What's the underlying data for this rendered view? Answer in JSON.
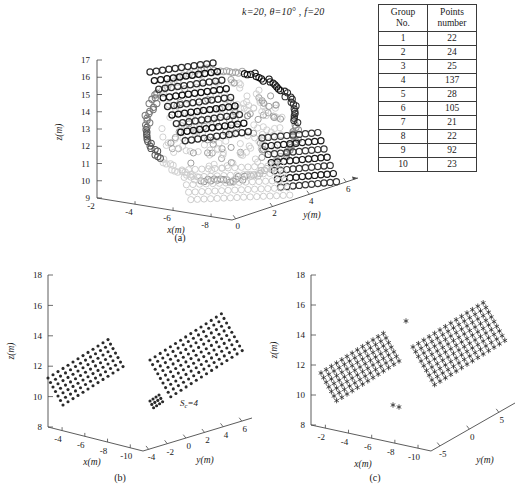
{
  "figure": {
    "title": {
      "k": "k=20",
      "theta": "θ=10°",
      "f": "f=20"
    },
    "captions": {
      "a": "(a)",
      "b": "(b)",
      "c": "(c)"
    }
  },
  "table": {
    "headers": {
      "col1_line1": "Group",
      "col1_line2": "No.",
      "col2_line1": "Points",
      "col2_line2": "number"
    },
    "rows": [
      {
        "group": "1",
        "points": "22"
      },
      {
        "group": "2",
        "points": "24"
      },
      {
        "group": "3",
        "points": "25"
      },
      {
        "group": "4",
        "points": "137"
      },
      {
        "group": "5",
        "points": "28"
      },
      {
        "group": "6",
        "points": "105"
      },
      {
        "group": "7",
        "points": "21"
      },
      {
        "group": "8",
        "points": "22"
      },
      {
        "group": "9",
        "points": "92"
      },
      {
        "group": "10",
        "points": "23"
      }
    ]
  },
  "panel_a": {
    "axis_labels": {
      "x": "x(m)",
      "y": "y(m)",
      "z": "z(m)"
    },
    "ticks": {
      "z": [
        "9",
        "10",
        "11",
        "12",
        "13",
        "14",
        "15",
        "16",
        "17"
      ],
      "x": [
        "-2",
        "-4",
        "-6",
        "-8"
      ],
      "y": [
        "0",
        "2",
        "4",
        "6"
      ]
    }
  },
  "panel_b": {
    "axis_labels": {
      "x": "x(m)",
      "y": "y(m)",
      "z": "z(m)"
    },
    "ticks": {
      "z": [
        "8",
        "10",
        "12",
        "14",
        "16",
        "18"
      ],
      "x": [
        "-4",
        "-6",
        "-8",
        "-10"
      ],
      "y": [
        "-4",
        "-2",
        "0",
        "2",
        "4",
        "6"
      ]
    },
    "annotation": {
      "symbol": "S",
      "subscript": "c",
      "value": "=4"
    }
  },
  "panel_c": {
    "axis_labels": {
      "x": "x(m)",
      "y": "y(m)",
      "z": "z(m)"
    },
    "ticks": {
      "z": [
        "8",
        "10",
        "12",
        "14",
        "16",
        "18"
      ],
      "x": [
        "-2",
        "-4",
        "-6",
        "-8",
        "-10"
      ],
      "y": [
        "-5",
        "0",
        "5"
      ]
    }
  },
  "chart_data": {
    "type": "scatter",
    "panels": [
      {
        "id": "a",
        "label": "(a)",
        "projection": "3d",
        "marker": "open-circle",
        "description": "Raw 3D point cloud of a building facade coloured by cluster group; dense ring-shaped scatter.",
        "xlabel": "x(m)",
        "ylabel": "y(m)",
        "zlabel": "z(m)",
        "xlim": [
          -9,
          -1
        ],
        "ylim": [
          -1,
          7
        ],
        "zlim": [
          8.5,
          17.5
        ],
        "xticks": [
          -2,
          -4,
          -6,
          -8
        ],
        "yticks": [
          0,
          2,
          4,
          6
        ],
        "zticks": [
          9,
          10,
          11,
          12,
          13,
          14,
          15,
          16,
          17
        ],
        "grid": false,
        "total_points": 499,
        "groups": [
          {
            "no": 1,
            "points": 22
          },
          {
            "no": 2,
            "points": 24
          },
          {
            "no": 3,
            "points": 25
          },
          {
            "no": 4,
            "points": 137
          },
          {
            "no": 5,
            "points": 28
          },
          {
            "no": 6,
            "points": 105
          },
          {
            "no": 7,
            "points": 21
          },
          {
            "no": 8,
            "points": 22
          },
          {
            "no": 9,
            "points": 92
          },
          {
            "no": 10,
            "points": 23
          }
        ]
      },
      {
        "id": "b",
        "label": "(b)",
        "projection": "3d",
        "marker": "filled-dot",
        "description": "Two extracted planar point bands (upper-right and lower-left) after segmentation with Sc=4.",
        "xlabel": "x(m)",
        "ylabel": "y(m)",
        "zlabel": "z(m)",
        "xlim": [
          -11,
          -3
        ],
        "ylim": [
          -5,
          6
        ],
        "zlim": [
          8,
          18
        ],
        "xticks": [
          -4,
          -6,
          -8,
          -10
        ],
        "yticks": [
          -4,
          -2,
          0,
          2,
          4,
          6
        ],
        "zticks": [
          8,
          10,
          12,
          14,
          16,
          18
        ],
        "grid": false,
        "annotation": "Sc=4",
        "clusters": 2
      },
      {
        "id": "c",
        "label": "(c)",
        "projection": "3d",
        "marker": "asterisk",
        "description": "Same two planar bands rendered with asterisk markers under a wider y range.",
        "xlabel": "x(m)",
        "ylabel": "y(m)",
        "zlabel": "z(m)",
        "xlim": [
          -11,
          -1
        ],
        "ylim": [
          -6,
          7
        ],
        "zlim": [
          8,
          18
        ],
        "xticks": [
          -2,
          -4,
          -6,
          -8,
          -10
        ],
        "yticks": [
          -5,
          0,
          5
        ],
        "zticks": [
          8,
          10,
          12,
          14,
          16,
          18
        ],
        "grid": false,
        "clusters": 2
      }
    ]
  }
}
